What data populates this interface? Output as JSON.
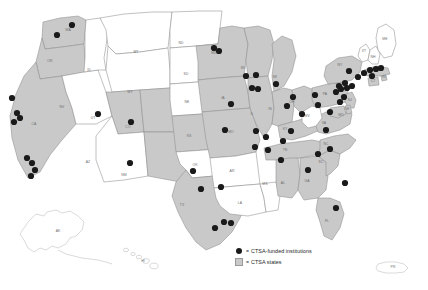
{
  "map": {
    "title": "CTSA-funded institutions and CTSA states",
    "projection": "albers-usa",
    "colors": {
      "shaded_state_fill": "#c9c9c9",
      "plain_state_fill": "#ffffff",
      "state_border": "#8e8e8e",
      "institution_dot": "#1a1a1a",
      "background": "#ffffff",
      "label_text": "#6d6d6d"
    },
    "legend": {
      "equals": "=",
      "rows": [
        {
          "marker": "dot",
          "label": "CTSA-funded institutions"
        },
        {
          "marker": "square",
          "label": "CTSA states"
        }
      ]
    },
    "states": [
      {
        "code": "WA",
        "shaded": true,
        "lx": 68,
        "ly": 31
      },
      {
        "code": "OR",
        "shaded": true,
        "lx": 50,
        "ly": 62
      },
      {
        "code": "CA",
        "shaded": true,
        "lx": 34,
        "ly": 125
      },
      {
        "code": "NV",
        "shaded": false,
        "lx": 62,
        "ly": 108
      },
      {
        "code": "ID",
        "shaded": false,
        "lx": 89,
        "ly": 71
      },
      {
        "code": "MT",
        "shaded": false,
        "lx": 136,
        "ly": 53
      },
      {
        "code": "WY",
        "shaded": false,
        "lx": 130,
        "ly": 93
      },
      {
        "code": "UT",
        "shaded": true,
        "lx": 93,
        "ly": 119
      },
      {
        "code": "AZ",
        "shaded": false,
        "lx": 88,
        "ly": 163
      },
      {
        "code": "CO",
        "shaded": true,
        "lx": 128,
        "ly": 128
      },
      {
        "code": "NM",
        "shaded": true,
        "lx": 124,
        "ly": 176
      },
      {
        "code": "ND",
        "shaded": false,
        "lx": 181,
        "ly": 44
      },
      {
        "code": "SD",
        "shaded": false,
        "lx": 186,
        "ly": 75
      },
      {
        "code": "NE",
        "shaded": false,
        "lx": 187,
        "ly": 103
      },
      {
        "code": "KS",
        "shaded": true,
        "lx": 189,
        "ly": 137
      },
      {
        "code": "OK",
        "shaded": false,
        "lx": 195,
        "ly": 166
      },
      {
        "code": "TX",
        "shaded": true,
        "lx": 182,
        "ly": 206
      },
      {
        "code": "MN",
        "shaded": true,
        "lx": 214,
        "ly": 54
      },
      {
        "code": "IA",
        "shaded": true,
        "lx": 223,
        "ly": 99
      },
      {
        "code": "MO",
        "shaded": true,
        "lx": 231,
        "ly": 133
      },
      {
        "code": "AR",
        "shaded": false,
        "lx": 232,
        "ly": 172
      },
      {
        "code": "LA",
        "shaded": false,
        "lx": 240,
        "ly": 204
      },
      {
        "code": "WI",
        "shaded": true,
        "lx": 243,
        "ly": 69
      },
      {
        "code": "IL",
        "shaded": true,
        "lx": 252,
        "ly": 115
      },
      {
        "code": "MS",
        "shaded": false,
        "lx": 265,
        "ly": 185
      },
      {
        "code": "MI",
        "shaded": true,
        "lx": 275,
        "ly": 78
      },
      {
        "code": "IN",
        "shaded": true,
        "lx": 270,
        "ly": 110
      },
      {
        "code": "KY",
        "shaded": true,
        "lx": 285,
        "ly": 130
      },
      {
        "code": "TN",
        "shaded": true,
        "lx": 285,
        "ly": 151
      },
      {
        "code": "AL",
        "shaded": true,
        "lx": 283,
        "ly": 184
      },
      {
        "code": "OH",
        "shaded": true,
        "lx": 292,
        "ly": 103
      },
      {
        "code": "GA",
        "shaded": true,
        "lx": 307,
        "ly": 182
      },
      {
        "code": "FL",
        "shaded": true,
        "lx": 327,
        "ly": 222
      },
      {
        "code": "SC",
        "shaded": true,
        "lx": 321,
        "ly": 163
      },
      {
        "code": "NC",
        "shaded": true,
        "lx": 326,
        "ly": 145
      },
      {
        "code": "VA",
        "shaded": true,
        "lx": 324,
        "ly": 124
      },
      {
        "code": "WV",
        "shaded": false,
        "lx": 307,
        "ly": 117
      },
      {
        "code": "PA",
        "shaded": true,
        "lx": 325,
        "ly": 95
      },
      {
        "code": "NY",
        "shaded": true,
        "lx": 340,
        "ly": 66
      },
      {
        "code": "ME",
        "shaded": false,
        "lx": 385,
        "ly": 40
      },
      {
        "code": "VT",
        "shaded": false,
        "lx": 364,
        "ly": 52
      },
      {
        "code": "NH",
        "shaded": false,
        "lx": 373,
        "ly": 58
      },
      {
        "code": "MA",
        "shaded": true,
        "lx": 378,
        "ly": 71
      },
      {
        "code": "RI",
        "shaded": true,
        "lx": 384,
        "ly": 78
      },
      {
        "code": "CT",
        "shaded": true,
        "lx": 373,
        "ly": 82
      },
      {
        "code": "NJ",
        "shaded": true,
        "lx": 350,
        "ly": 101
      },
      {
        "code": "DE",
        "shaded": true,
        "lx": 347,
        "ly": 110
      },
      {
        "code": "MD",
        "shaded": true,
        "lx": 341,
        "ly": 116
      },
      {
        "code": "AK",
        "shaded": false,
        "lx": 58,
        "ly": 232
      },
      {
        "code": "HI",
        "shaded": false,
        "lx": 143,
        "ly": 262
      },
      {
        "code": "PR",
        "shaded": false,
        "lx": 393,
        "ly": 268
      }
    ],
    "institutions": [
      {
        "x": 72,
        "y": 25
      },
      {
        "x": 57,
        "y": 35
      },
      {
        "x": 12,
        "y": 98
      },
      {
        "x": 17,
        "y": 113
      },
      {
        "x": 20,
        "y": 118
      },
      {
        "x": 14,
        "y": 122
      },
      {
        "x": 27,
        "y": 158
      },
      {
        "x": 32,
        "y": 163
      },
      {
        "x": 35,
        "y": 170
      },
      {
        "x": 31,
        "y": 176
      },
      {
        "x": 98,
        "y": 114
      },
      {
        "x": 131,
        "y": 122
      },
      {
        "x": 130,
        "y": 163
      },
      {
        "x": 214,
        "y": 48
      },
      {
        "x": 219,
        "y": 51
      },
      {
        "x": 246,
        "y": 76
      },
      {
        "x": 256,
        "y": 75
      },
      {
        "x": 252,
        "y": 88
      },
      {
        "x": 258,
        "y": 89
      },
      {
        "x": 276,
        "y": 84
      },
      {
        "x": 231,
        "y": 104
      },
      {
        "x": 225,
        "y": 130
      },
      {
        "x": 256,
        "y": 131
      },
      {
        "x": 266,
        "y": 137
      },
      {
        "x": 283,
        "y": 141
      },
      {
        "x": 291,
        "y": 131
      },
      {
        "x": 302,
        "y": 114
      },
      {
        "x": 287,
        "y": 106
      },
      {
        "x": 293,
        "y": 97
      },
      {
        "x": 315,
        "y": 95
      },
      {
        "x": 318,
        "y": 105
      },
      {
        "x": 330,
        "y": 112
      },
      {
        "x": 340,
        "y": 102
      },
      {
        "x": 344,
        "y": 97
      },
      {
        "x": 336,
        "y": 92
      },
      {
        "x": 341,
        "y": 89
      },
      {
        "x": 347,
        "y": 88
      },
      {
        "x": 352,
        "y": 86
      },
      {
        "x": 345,
        "y": 83
      },
      {
        "x": 339,
        "y": 86
      },
      {
        "x": 358,
        "y": 77
      },
      {
        "x": 364,
        "y": 73
      },
      {
        "x": 370,
        "y": 70
      },
      {
        "x": 376,
        "y": 69
      },
      {
        "x": 381,
        "y": 68
      },
      {
        "x": 372,
        "y": 76
      },
      {
        "x": 349,
        "y": 71
      },
      {
        "x": 326,
        "y": 130
      },
      {
        "x": 330,
        "y": 149
      },
      {
        "x": 318,
        "y": 154
      },
      {
        "x": 308,
        "y": 170
      },
      {
        "x": 345,
        "y": 183
      },
      {
        "x": 336,
        "y": 208
      },
      {
        "x": 281,
        "y": 160
      },
      {
        "x": 268,
        "y": 150
      },
      {
        "x": 255,
        "y": 147
      },
      {
        "x": 221,
        "y": 187
      },
      {
        "x": 201,
        "y": 189
      },
      {
        "x": 215,
        "y": 228
      },
      {
        "x": 224,
        "y": 222
      },
      {
        "x": 231,
        "y": 223
      },
      {
        "x": 193,
        "y": 171
      }
    ]
  }
}
